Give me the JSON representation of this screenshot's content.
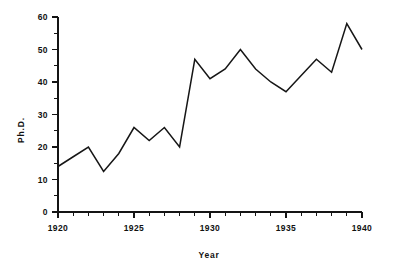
{
  "chart_data": {
    "type": "line",
    "title": "",
    "xlabel": "Year",
    "ylabel": "Ph.D.",
    "xlim": [
      1920,
      1940
    ],
    "ylim": [
      0,
      60
    ],
    "grid": false,
    "legend": null,
    "x_major_ticks": [
      1920,
      1925,
      1930,
      1935,
      1940
    ],
    "x_tick_labels": [
      "1920",
      "1925",
      "1930",
      "1935",
      "1940"
    ],
    "x_minor_tick_step": 1,
    "y_major_ticks": [
      0,
      10,
      20,
      30,
      40,
      50,
      60
    ],
    "y_tick_labels": [
      "0",
      "10",
      "20",
      "30",
      "40",
      "50",
      "60"
    ],
    "y_minor_tick_step": 5,
    "line_color": "#161616",
    "background_color": "#ffffff",
    "x": [
      1920,
      1921,
      1922,
      1923,
      1924,
      1925,
      1926,
      1927,
      1928,
      1929,
      1930,
      1931,
      1932,
      1933,
      1934,
      1935,
      1936,
      1937,
      1938,
      1939,
      1940
    ],
    "values": [
      14,
      17,
      20,
      12.5,
      18,
      26,
      22,
      26,
      20,
      47,
      41,
      44,
      50,
      44,
      40,
      37,
      42,
      47,
      43,
      58,
      50
    ],
    "series": [
      {
        "name": "Ph.D.",
        "values": [
          14,
          17,
          20,
          12.5,
          18,
          26,
          22,
          26,
          20,
          47,
          41,
          44,
          50,
          44,
          40,
          37,
          42,
          47,
          43,
          58,
          50
        ]
      }
    ]
  },
  "axes": {
    "x_title": "Year",
    "y_title": "Ph.D."
  }
}
